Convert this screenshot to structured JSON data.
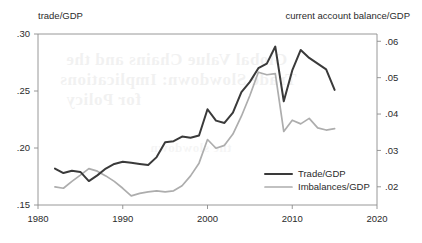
{
  "figure": {
    "left_axis_caption": "trade/GDP",
    "right_axis_caption": "current account balance/GDP",
    "bleed_through": {
      "line1": "Global Value Chains and the",
      "line2": "Trade Slowdown: Implications",
      "line3": "for Policy",
      "line4": "the slowdown"
    }
  },
  "legend": {
    "position": "inside-bottom-right",
    "entries": [
      {
        "label": "Trade/GDP",
        "color": "#3a3a3a"
      },
      {
        "label": "Imbalances/GDP",
        "color": "#adadad"
      }
    ]
  },
  "chart_data": {
    "type": "line",
    "title": "",
    "subtitle": "",
    "xlabel": "",
    "ylabel": "trade/GDP",
    "y2label": "current account balance/GDP",
    "grid": false,
    "xlim": [
      1980,
      2020
    ],
    "ylim": [
      0.15,
      0.3
    ],
    "y2lim": [
      0.015,
      0.062
    ],
    "xticks": [
      1980,
      1990,
      2000,
      2010,
      2020
    ],
    "xtick_labels": [
      "1980",
      "1990",
      "2000",
      "2010",
      "2020"
    ],
    "yticks": [
      0.15,
      0.2,
      0.25,
      0.3
    ],
    "ytick_labels": [
      ".15",
      ".20",
      ".25",
      ".30"
    ],
    "y2ticks": [
      0.02,
      0.03,
      0.04,
      0.05,
      0.06
    ],
    "y2tick_labels": [
      ".02",
      ".03",
      ".04",
      ".05",
      ".06"
    ],
    "x": [
      1982,
      1983,
      1984,
      1985,
      1986,
      1987,
      1988,
      1989,
      1990,
      1991,
      1992,
      1993,
      1994,
      1995,
      1996,
      1997,
      1998,
      1999,
      2000,
      2001,
      2002,
      2003,
      2004,
      2005,
      2006,
      2007,
      2008,
      2009,
      2010,
      2011,
      2012,
      2013,
      2014,
      2015
    ],
    "series": [
      {
        "name": "Trade/GDP",
        "axis": "left",
        "color": "#3a3a3a",
        "values": [
          0.182,
          0.178,
          0.18,
          0.179,
          0.171,
          0.176,
          0.182,
          0.186,
          0.188,
          0.187,
          0.186,
          0.185,
          0.192,
          0.205,
          0.206,
          0.21,
          0.209,
          0.211,
          0.234,
          0.224,
          0.222,
          0.231,
          0.249,
          0.258,
          0.27,
          0.274,
          0.289,
          0.241,
          0.268,
          0.286,
          0.279,
          0.274,
          0.269,
          0.251
        ]
      },
      {
        "name": "Imbalances/GDP",
        "axis": "right",
        "color": "#adadad",
        "values": [
          0.02,
          0.0196,
          0.0215,
          0.0232,
          0.025,
          0.0243,
          0.023,
          0.0215,
          0.0196,
          0.0175,
          0.0182,
          0.0186,
          0.0189,
          0.0186,
          0.0189,
          0.0203,
          0.023,
          0.0265,
          0.033,
          0.0306,
          0.0314,
          0.0345,
          0.0394,
          0.0451,
          0.0515,
          0.0508,
          0.0511,
          0.0352,
          0.0383,
          0.0373,
          0.0388,
          0.0362,
          0.0356,
          0.036
        ]
      }
    ]
  }
}
